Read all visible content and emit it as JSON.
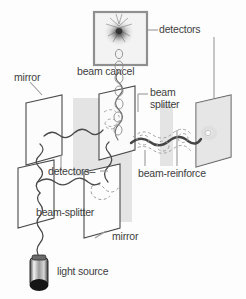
{
  "figure": {
    "background_color": "#fdfdfd",
    "ink_color": "#3d3d3d",
    "panel_fill": "#fafafa",
    "shadow_fill": "#e2e2e2",
    "detector_screen_fill": "#f2f2f2",
    "detector_border": "#8c8c8c"
  },
  "labels": {
    "detectors_top": "detectors",
    "beam_cancel": "beam cancel",
    "mirror_left": "mirror",
    "beam_splitter_line1": "beam",
    "beam_splitter_line2": "splitter",
    "detectors_mid": "detectors–",
    "beam_reinforce": "beam-reinforce",
    "beam_splitter_lower": "beam-splitter",
    "mirror_bottom": "mirror",
    "light_source": "light source"
  },
  "components": [
    {
      "name": "light-source",
      "type": "laser",
      "label": "light source"
    },
    {
      "name": "beam-splitter-lower",
      "type": "beam-splitter",
      "label": "beam-splitter"
    },
    {
      "name": "mirror-left",
      "type": "mirror",
      "label": "mirror"
    },
    {
      "name": "mirror-bottom",
      "type": "mirror",
      "label": "mirror"
    },
    {
      "name": "beam-splitter-upper",
      "type": "beam-splitter",
      "label": "beam splitter"
    },
    {
      "name": "detector-top",
      "type": "detector-screen",
      "label": "detectors",
      "result": "beam cancel"
    },
    {
      "name": "detector-right",
      "type": "detector-screen",
      "label": "detectors",
      "result": "beam-reinforce"
    }
  ],
  "annotations": {
    "destructive_interference": "beam cancel",
    "constructive_interference": "beam-reinforce"
  }
}
